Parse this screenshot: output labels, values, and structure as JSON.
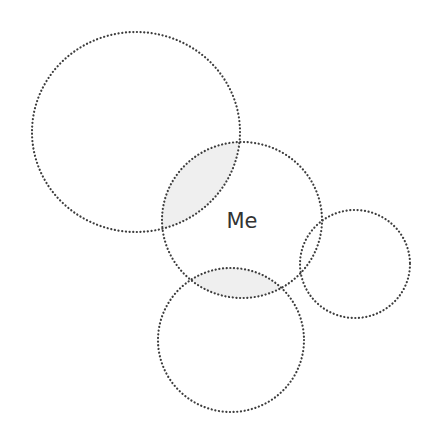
{
  "diagram": {
    "type": "venn-style relationship diagram",
    "width": 429,
    "height": 435,
    "background": "#ffffff",
    "stroke_color": "#3d3d3d",
    "overlap_fill": "#efefef",
    "circles": [
      {
        "id": "top-left",
        "cx": 136,
        "cy": 132,
        "rx": 104,
        "ry": 100,
        "label": ""
      },
      {
        "id": "me",
        "cx": 242,
        "cy": 220,
        "rx": 80,
        "ry": 78,
        "label": "Me"
      },
      {
        "id": "bottom",
        "cx": 231,
        "cy": 340,
        "rx": 73,
        "ry": 72,
        "label": ""
      },
      {
        "id": "right",
        "cx": 355,
        "cy": 264,
        "rx": 55,
        "ry": 54,
        "label": ""
      }
    ],
    "shaded_overlaps": [
      [
        "top-left",
        "me"
      ],
      [
        "me",
        "bottom"
      ]
    ],
    "center_label": "Me"
  }
}
